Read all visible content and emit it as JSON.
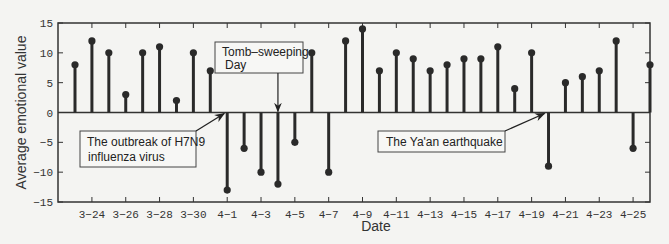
{
  "chart_data": {
    "type": "stem",
    "title": "",
    "xlabel": "Date",
    "ylabel": "Average emotional value",
    "ylim": [
      -15,
      15
    ],
    "yticks": [
      -15,
      -10,
      -5,
      0,
      5,
      10,
      15
    ],
    "xtick_labels": [
      "3-24",
      "3-26",
      "3-28",
      "3-30",
      "4-1",
      "4-3",
      "4-5",
      "4-7",
      "4-9",
      "4-11",
      "4-13",
      "4-15",
      "4-17",
      "4-19",
      "4-21",
      "4-23",
      "4-25"
    ],
    "grid": false,
    "categories": [
      "3-23",
      "3-24",
      "3-25",
      "3-26",
      "3-27",
      "3-28",
      "3-29",
      "3-30",
      "3-31",
      "4-1",
      "4-2",
      "4-3",
      "4-4",
      "4-5",
      "4-6",
      "4-7",
      "4-8",
      "4-9",
      "4-10",
      "4-11",
      "4-12",
      "4-13",
      "4-14",
      "4-15",
      "4-16",
      "4-17",
      "4-18",
      "4-19",
      "4-20",
      "4-21",
      "4-22",
      "4-23",
      "4-24",
      "4-25",
      "4-26"
    ],
    "values": [
      8,
      12,
      10,
      3,
      10,
      11,
      2,
      10,
      7,
      -13,
      -6,
      -10,
      -12,
      -5,
      10,
      -10,
      12,
      14,
      7,
      10,
      9,
      7,
      8,
      9,
      9,
      11,
      4,
      10,
      -9,
      5,
      6,
      7,
      12,
      -6,
      8
    ],
    "annotations": [
      {
        "text": [
          "The outbreak of H7N9",
          "influenza virus"
        ],
        "target": "4-1"
      },
      {
        "text": [
          "Tomb–sweeping",
          "Day"
        ],
        "target": "4-4"
      },
      {
        "text": [
          "The Ya'an earthquake"
        ],
        "target": "4-20"
      }
    ]
  },
  "colors": {
    "stem": "#2a2a2a",
    "axis": "#333333",
    "background": "#f4f4f2"
  }
}
